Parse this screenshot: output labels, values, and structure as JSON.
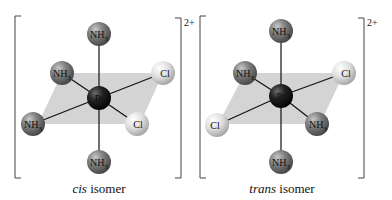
{
  "colors": {
    "background": "#ffffff",
    "plane": "#cfcfcf",
    "bond": "#111111",
    "bracket": "#444444",
    "pt": "#1e1e1e",
    "nh3": "#7a7a7a",
    "cl": "#d9d9d9"
  },
  "complexes": [
    {
      "id": "cis",
      "charge": "2+",
      "caption_italic": "cis",
      "caption_rest": " isomer",
      "center": {
        "label": "Pt",
        "x": 99,
        "y": 98
      },
      "ligands": [
        {
          "label": "NH3",
          "type": "nh3",
          "x": 99,
          "y": 34,
          "position": "axial-top"
        },
        {
          "label": "NH3",
          "type": "nh3",
          "x": 99,
          "y": 162,
          "position": "axial-bottom"
        },
        {
          "label": "NH3",
          "type": "nh3",
          "x": 62,
          "y": 73,
          "position": "equatorial-back-left"
        },
        {
          "label": "NH3",
          "type": "nh3",
          "x": 33,
          "y": 124,
          "position": "equatorial-front-left"
        },
        {
          "label": "Cl",
          "type": "cl",
          "x": 163,
          "y": 73,
          "position": "equatorial-back-right"
        },
        {
          "label": "Cl",
          "type": "cl",
          "x": 137,
          "y": 124,
          "position": "equatorial-front-right"
        }
      ]
    },
    {
      "id": "trans",
      "charge": "2+",
      "caption_italic": "trans",
      "caption_rest": " isomer",
      "center": {
        "label": "Pt",
        "x": 281,
        "y": 96
      },
      "ligands": [
        {
          "label": "NH3",
          "type": "nh3",
          "x": 281,
          "y": 31,
          "position": "axial-top"
        },
        {
          "label": "NH3",
          "type": "nh3",
          "x": 281,
          "y": 162,
          "position": "axial-bottom"
        },
        {
          "label": "NH3",
          "type": "nh3",
          "x": 245,
          "y": 73,
          "position": "equatorial-back-left"
        },
        {
          "label": "Cl",
          "type": "cl",
          "x": 217,
          "y": 125,
          "position": "equatorial-front-left"
        },
        {
          "label": "Cl",
          "type": "cl",
          "x": 344,
          "y": 73,
          "position": "equatorial-back-right"
        },
        {
          "label": "NH3",
          "type": "nh3",
          "x": 317,
          "y": 124,
          "position": "equatorial-front-right"
        }
      ]
    }
  ]
}
